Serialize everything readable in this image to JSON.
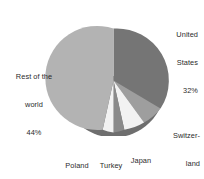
{
  "chart_data": {
    "type": "pie",
    "title": "",
    "subtitle": "",
    "xlabel": "",
    "ylabel": "",
    "legend_position": "outside-labels",
    "grid": false,
    "start_angle_clock": "12 o'clock",
    "direction": "clockwise",
    "style": "3d-pie-with-shadow-rim",
    "categories": [
      "United States",
      "Switzerland",
      "Japan",
      "Turkey",
      "Poland",
      "Rest of the world"
    ],
    "values": [
      32,
      8,
      8,
      4,
      4,
      44
    ],
    "value_suffix": "%",
    "colors": [
      "#757575",
      "#9e9e9e",
      "#f2f2f2",
      "#8a8a8a",
      "#f2f2f2",
      "#b3b3b3"
    ],
    "slices": [
      {
        "name": "United States",
        "value": 32,
        "value_label": "32%",
        "color": "#757575"
      },
      {
        "name": "Switzerland",
        "value": 8,
        "value_label": "8%",
        "color": "#9e9e9e"
      },
      {
        "name": "Japan",
        "value": 8,
        "value_label": "8%",
        "color": "#f2f2f2"
      },
      {
        "name": "Turkey",
        "value": 4,
        "value_label": "4%",
        "color": "#8a8a8a"
      },
      {
        "name": "Poland",
        "value": 4,
        "value_label": "4%",
        "color": "#f2f2f2"
      },
      {
        "name": "Rest of the world",
        "value": 44,
        "value_label": "44%",
        "color": "#b3b3b3"
      }
    ]
  },
  "labels": {
    "united_states": {
      "line1": "United",
      "line2": "States",
      "value": "32%"
    },
    "switzerland": {
      "line1": "Switzer-",
      "line2": "land",
      "value": "8%"
    },
    "japan": {
      "line1": "Japan",
      "value": "8%"
    },
    "turkey": {
      "line1": "Turkey",
      "value": "4%"
    },
    "poland": {
      "line1": "Poland",
      "value": "4%"
    },
    "rest_of_world": {
      "line1": "Rest of the",
      "line2": "world",
      "value": "44%"
    }
  }
}
